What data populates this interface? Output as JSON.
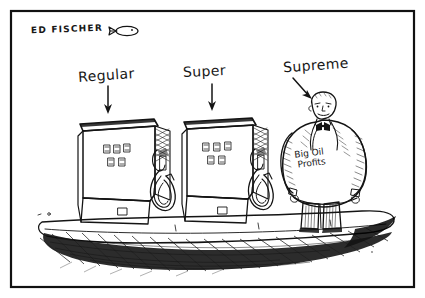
{
  "artwork": {
    "kind": "editorial-cartoon",
    "medium": "pen-and-ink",
    "background_color": "#ffffff",
    "ink_color": "#141414",
    "frame": {
      "border_color": "#111111",
      "border_width_px": 2,
      "inset_px": 10
    }
  },
  "signature": {
    "artist": "ED FISCHER",
    "doodle_icon": "fish-doodle-icon"
  },
  "labels": {
    "pump_left": "Regular",
    "pump_right": "Super",
    "figure": "Supreme",
    "arrow_icon": "down-arrow-icon",
    "arrow_diagonal_icon": "diagonal-arrow-icon"
  },
  "figure": {
    "belly_line_1": "Big Oil",
    "belly_line_2": "Profits",
    "description_icon": "fat-businessman-icon",
    "accessories": [
      "bald-head-icon",
      "bow-tie-icon",
      "striped-trousers-icon"
    ]
  },
  "pumps": [
    {
      "name": "regular-pump",
      "display_top_digits": [
        "8",
        "8",
        "8"
      ],
      "display_bottom_digits": [
        "8",
        "8"
      ],
      "hose_icon": "fuel-hose-icon",
      "nozzle_icon": "fuel-nozzle-icon"
    },
    {
      "name": "super-pump",
      "display_top_digits": [
        "8",
        "8",
        "8"
      ],
      "display_bottom_digits": [
        "8",
        "8"
      ],
      "hose_icon": "fuel-hose-icon",
      "nozzle_icon": "fuel-nozzle-icon"
    }
  ],
  "scene": {
    "platform_name": "gas-station-island",
    "shadow_name": "cross-hatched-shadow"
  }
}
